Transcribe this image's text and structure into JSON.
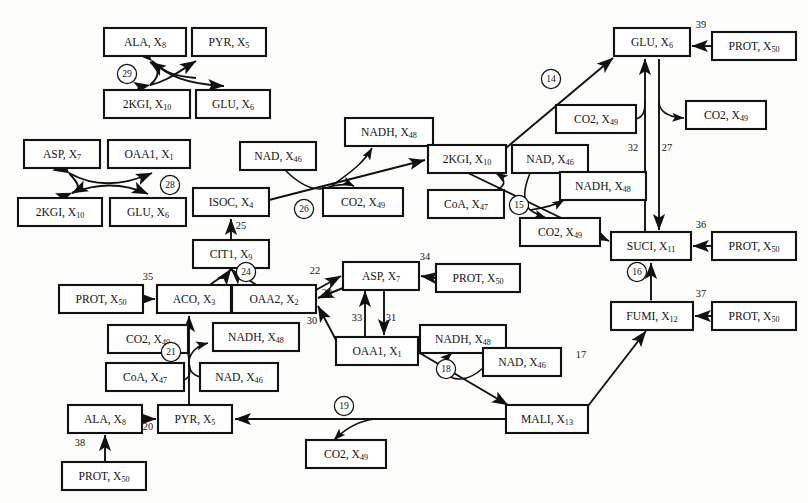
{
  "diagram": {
    "type": "directed-graph",
    "box_fill": "#ffffff",
    "stroke": "#111111",
    "background": "#fdfdfb"
  },
  "nodes": [
    {
      "id": "n_ala_top",
      "name": "ALA",
      "var": "8",
      "x": 104,
      "y": 28,
      "w": 82,
      "h": 28
    },
    {
      "id": "n_pyr_top",
      "name": "PYR",
      "var": "5",
      "x": 192,
      "y": 28,
      "w": 74,
      "h": 28
    },
    {
      "id": "n_2kgi_top",
      "name": "2KGI",
      "var": "10",
      "x": 104,
      "y": 90,
      "w": 86,
      "h": 28
    },
    {
      "id": "n_glu_top",
      "name": "GLU",
      "var": "6",
      "x": 196,
      "y": 90,
      "w": 74,
      "h": 28
    },
    {
      "id": "n_asp_l",
      "name": "ASP",
      "var": "7",
      "x": 24,
      "y": 140,
      "w": 76,
      "h": 28
    },
    {
      "id": "n_oaa1_l",
      "name": "OAA1",
      "var": "1",
      "x": 108,
      "y": 140,
      "w": 82,
      "h": 28
    },
    {
      "id": "n_2kgi_l",
      "name": "2KGI",
      "var": "10",
      "x": 18,
      "y": 198,
      "w": 84,
      "h": 28
    },
    {
      "id": "n_glu_l",
      "name": "GLU",
      "var": "6",
      "x": 110,
      "y": 198,
      "w": 76,
      "h": 28
    },
    {
      "id": "n_isoc",
      "name": "ISOC",
      "var": "4",
      "x": 193,
      "y": 188,
      "w": 76,
      "h": 28
    },
    {
      "id": "n_cit1",
      "name": "CIT1",
      "var": "9",
      "x": 193,
      "y": 240,
      "w": 76,
      "h": 28
    },
    {
      "id": "n_aco",
      "name": "ACO",
      "var": "3",
      "x": 157,
      "y": 285,
      "w": 74,
      "h": 28
    },
    {
      "id": "n_oaa2",
      "name": "OAA2",
      "var": "2",
      "x": 232,
      "y": 285,
      "w": 84,
      "h": 28
    },
    {
      "id": "n_prot35",
      "name": "PROT",
      "var": "50",
      "x": 59,
      "y": 285,
      "w": 84,
      "h": 28
    },
    {
      "id": "n_nad46_a",
      "name": "NAD",
      "var": "46",
      "x": 240,
      "y": 142,
      "w": 76,
      "h": 28
    },
    {
      "id": "n_nadh_a",
      "name": "NADH",
      "var": "48",
      "x": 345,
      "y": 118,
      "w": 88,
      "h": 28
    },
    {
      "id": "n_co2_a",
      "name": "CO2",
      "var": "49",
      "x": 323,
      "y": 188,
      "w": 80,
      "h": 28
    },
    {
      "id": "n_2kgi_c",
      "name": "2KGI",
      "var": "10",
      "x": 428,
      "y": 145,
      "w": 78,
      "h": 28
    },
    {
      "id": "n_coa_c",
      "name": "CoA",
      "var": "47",
      "x": 428,
      "y": 190,
      "w": 76,
      "h": 28
    },
    {
      "id": "n_nad_c",
      "name": "NAD",
      "var": "46",
      "x": 512,
      "y": 145,
      "w": 76,
      "h": 28
    },
    {
      "id": "n_nadh_c",
      "name": "NADH",
      "var": "48",
      "x": 560,
      "y": 172,
      "w": 86,
      "h": 28
    },
    {
      "id": "n_co2_c",
      "name": "CO2",
      "var": "49",
      "x": 520,
      "y": 218,
      "w": 80,
      "h": 28
    },
    {
      "id": "n_glu_tr",
      "name": "GLU",
      "var": "6",
      "x": 614,
      "y": 28,
      "w": 76,
      "h": 28
    },
    {
      "id": "n_prot39",
      "name": "PROT",
      "var": "50",
      "x": 712,
      "y": 32,
      "w": 84,
      "h": 28
    },
    {
      "id": "n_co2_in",
      "name": "CO2",
      "var": "49",
      "x": 556,
      "y": 105,
      "w": 80,
      "h": 28
    },
    {
      "id": "n_co2_out",
      "name": "CO2",
      "var": "49",
      "x": 686,
      "y": 101,
      "w": 80,
      "h": 28
    },
    {
      "id": "n_suci",
      "name": "SUCI",
      "var": "11",
      "x": 611,
      "y": 232,
      "w": 80,
      "h": 28
    },
    {
      "id": "n_prot36",
      "name": "PROT",
      "var": "50",
      "x": 712,
      "y": 232,
      "w": 84,
      "h": 28
    },
    {
      "id": "n_fumi",
      "name": "FUMI",
      "var": "12",
      "x": 611,
      "y": 302,
      "w": 82,
      "h": 28
    },
    {
      "id": "n_prot37",
      "name": "PROT",
      "var": "50",
      "x": 712,
      "y": 302,
      "w": 84,
      "h": 28
    },
    {
      "id": "n_asp_c",
      "name": "ASP",
      "var": "7",
      "x": 343,
      "y": 262,
      "w": 76,
      "h": 28
    },
    {
      "id": "n_prot34",
      "name": "PROT",
      "var": "50",
      "x": 436,
      "y": 264,
      "w": 84,
      "h": 28
    },
    {
      "id": "n_oaa1_c",
      "name": "OAA1",
      "var": "1",
      "x": 336,
      "y": 337,
      "w": 82,
      "h": 28
    },
    {
      "id": "n_nadh_b",
      "name": "NADH",
      "var": "48",
      "x": 420,
      "y": 325,
      "w": 86,
      "h": 28
    },
    {
      "id": "n_nad_b",
      "name": "NAD",
      "var": "46",
      "x": 483,
      "y": 348,
      "w": 78,
      "h": 28
    },
    {
      "id": "n_mali",
      "name": "MALI",
      "var": "13",
      "x": 506,
      "y": 405,
      "w": 82,
      "h": 28
    },
    {
      "id": "n_co2_21",
      "name": "CO2",
      "var": "49",
      "x": 108,
      "y": 325,
      "w": 80,
      "h": 28
    },
    {
      "id": "n_nadh_21",
      "name": "NADH",
      "var": "48",
      "x": 213,
      "y": 323,
      "w": 86,
      "h": 28
    },
    {
      "id": "n_nad_21",
      "name": "NAD",
      "var": "46",
      "x": 200,
      "y": 363,
      "w": 78,
      "h": 28
    },
    {
      "id": "n_coa_21",
      "name": "CoA",
      "var": "47",
      "x": 106,
      "y": 363,
      "w": 78,
      "h": 28
    },
    {
      "id": "n_ala_b",
      "name": "ALA",
      "var": "8",
      "x": 68,
      "y": 405,
      "w": 74,
      "h": 28
    },
    {
      "id": "n_pyr_b",
      "name": "PYR",
      "var": "5",
      "x": 158,
      "y": 405,
      "w": 74,
      "h": 28
    },
    {
      "id": "n_prot38",
      "name": "PROT",
      "var": "50",
      "x": 62,
      "y": 462,
      "w": 84,
      "h": 28
    },
    {
      "id": "n_co2_19",
      "name": "CO2",
      "var": "49",
      "x": 306,
      "y": 440,
      "w": 80,
      "h": 28
    }
  ],
  "reaction_numbers": [
    {
      "id": "r14",
      "label": "14",
      "style": "circle",
      "x": 551,
      "y": 79
    },
    {
      "id": "r15",
      "label": "15",
      "style": "circle",
      "x": 519,
      "y": 205
    },
    {
      "id": "r16",
      "label": "16",
      "style": "circle",
      "x": 637,
      "y": 272
    },
    {
      "id": "r18",
      "label": "18",
      "style": "circle",
      "x": 446,
      "y": 369
    },
    {
      "id": "r19",
      "label": "19",
      "style": "circle",
      "x": 344,
      "y": 406
    },
    {
      "id": "r21",
      "label": "21",
      "style": "circle",
      "x": 171,
      "y": 352
    },
    {
      "id": "r24",
      "label": "24",
      "style": "circle",
      "x": 246,
      "y": 272
    },
    {
      "id": "r26",
      "label": "26",
      "style": "circle",
      "x": 304,
      "y": 209
    },
    {
      "id": "r28",
      "label": "28",
      "style": "circle",
      "x": 170,
      "y": 185
    },
    {
      "id": "r29",
      "label": "29",
      "style": "circle",
      "x": 127,
      "y": 74
    },
    {
      "id": "r17",
      "label": "17",
      "style": "plain",
      "x": 581,
      "y": 355
    },
    {
      "id": "r20",
      "label": "20",
      "style": "plain",
      "x": 148,
      "y": 427
    },
    {
      "id": "r22",
      "label": "22",
      "style": "plain",
      "x": 315,
      "y": 271
    },
    {
      "id": "r23",
      "label": "23",
      "style": "plain",
      "x": 327,
      "y": 293
    },
    {
      "id": "r25",
      "label": "25",
      "style": "plain",
      "x": 241,
      "y": 226
    },
    {
      "id": "r27",
      "label": "27",
      "style": "plain",
      "x": 667,
      "y": 148
    },
    {
      "id": "r30",
      "label": "30",
      "style": "plain",
      "x": 312,
      "y": 321
    },
    {
      "id": "r31",
      "label": "31",
      "style": "plain",
      "x": 391,
      "y": 318
    },
    {
      "id": "r32",
      "label": "32",
      "style": "plain",
      "x": 633,
      "y": 148
    },
    {
      "id": "r33",
      "label": "33",
      "style": "plain",
      "x": 357,
      "y": 318
    },
    {
      "id": "r34",
      "label": "34",
      "style": "plain",
      "x": 425,
      "y": 257
    },
    {
      "id": "r35",
      "label": "35",
      "style": "plain",
      "x": 148,
      "y": 277
    },
    {
      "id": "r36",
      "label": "36",
      "style": "plain",
      "x": 701,
      "y": 225
    },
    {
      "id": "r37",
      "label": "37",
      "style": "plain",
      "x": 701,
      "y": 294
    },
    {
      "id": "r38",
      "label": "38",
      "style": "plain",
      "x": 80,
      "y": 443
    },
    {
      "id": "r39",
      "label": "39",
      "style": "plain",
      "x": 701,
      "y": 25
    }
  ]
}
